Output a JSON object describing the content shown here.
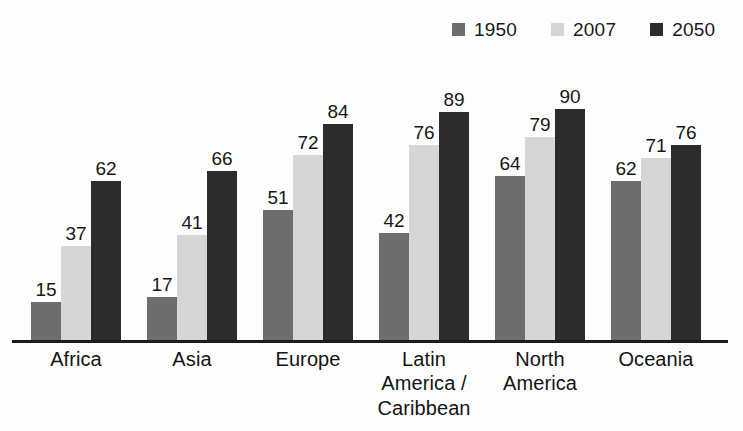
{
  "chart_data": {
    "type": "bar",
    "title": "",
    "subtitle": "",
    "xlabel": "",
    "ylabel": "",
    "ylim": [
      0,
      100
    ],
    "grid": false,
    "legend_position": "top-right",
    "categories": [
      "Africa",
      "Asia",
      "Europe",
      "Latin America / Caribbean",
      "North America",
      "Oceania"
    ],
    "category_lines": [
      [
        "Africa"
      ],
      [
        "Asia"
      ],
      [
        "Europe"
      ],
      [
        "Latin",
        "America /",
        "Caribbean"
      ],
      [
        "North",
        "America"
      ],
      [
        "Oceania"
      ]
    ],
    "series": [
      {
        "name": "1950",
        "color": "#6e6e6e",
        "values": [
          15,
          17,
          51,
          42,
          64,
          62
        ]
      },
      {
        "name": "2007",
        "color": "#d6d6d6",
        "values": [
          37,
          41,
          72,
          76,
          79,
          71
        ]
      },
      {
        "name": "2050",
        "color": "#2b2b2b",
        "values": [
          62,
          66,
          84,
          89,
          90,
          76
        ]
      }
    ]
  },
  "legend": {
    "items": [
      {
        "label": "1950",
        "color": "#6e6e6e",
        "swatch_name": "legend-swatch-1950"
      },
      {
        "label": "2007",
        "color": "#d6d6d6",
        "swatch_name": "legend-swatch-2007"
      },
      {
        "label": "2050",
        "color": "#2b2b2b",
        "swatch_name": "legend-swatch-2050"
      }
    ]
  },
  "axis": {
    "baseline_color": "#1c1c1c"
  }
}
